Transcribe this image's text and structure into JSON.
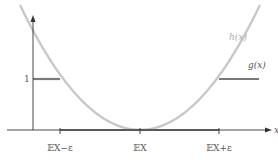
{
  "diagram": {
    "type": "function-plot",
    "colors": {
      "axis": "#333333",
      "g_curve": "#7a7a7a",
      "h_curve": "#c8c8c8",
      "h_label": "#aaaaaa",
      "text": "#555555"
    },
    "labels": {
      "x_axis": "x",
      "y_one": "1",
      "h_curve": "h(x)",
      "g_curve": "g(x)"
    },
    "x_ticks": [
      {
        "label": "𝔼X−ε",
        "pos": 60
      },
      {
        "label": "𝔼X",
        "pos": 140
      },
      {
        "label": "𝔼X+ε",
        "pos": 219
      }
    ],
    "curves": {
      "h": "parabola (x - EX)^2 / ε^2, vertex at EX on x-axis",
      "g": "1 for x < EX-ε, 0 on [EX-ε, EX+ε], 1 for x > EX+ε"
    }
  }
}
